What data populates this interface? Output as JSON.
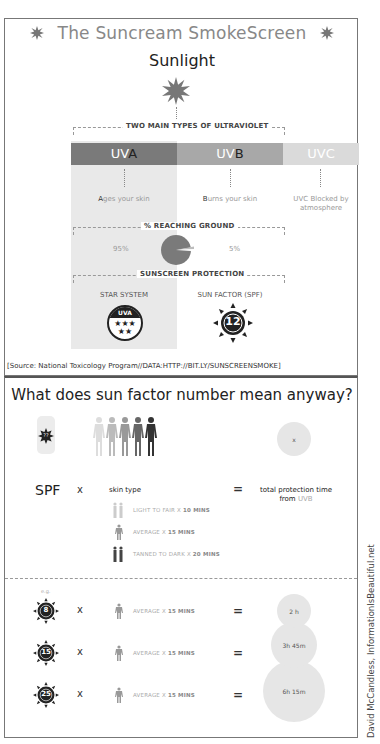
{
  "header": {
    "title": "The Suncream SmokeScreen",
    "subtitle": "Sunlight"
  },
  "uv_types": {
    "bracket_label": "TWO MAIN TYPES OF ULTRAVIOLET",
    "items": [
      {
        "prefix": "UV",
        "letter": "A",
        "desc_letter": "A",
        "desc_rest": "ges your skin",
        "color": "#7a7a7a"
      },
      {
        "prefix": "UV",
        "letter": "B",
        "desc_letter": "B",
        "desc_rest": "urns your skin",
        "color": "#a8a8a8"
      },
      {
        "prefix": "UVC",
        "letter": "",
        "desc_letter": "",
        "desc_rest": "UVC Blocked by atmosphere",
        "color": "#dadada"
      }
    ]
  },
  "reaching_ground": {
    "bracket_label": "% REACHING GROUND",
    "uva_pct": "95%",
    "uvb_pct": "5%",
    "pie_color": "#7a7a7a",
    "slice_color": "#bdbdbd"
  },
  "protection": {
    "bracket_label": "SUNSCREEN PROTECTION",
    "star_label": "STAR SYSTEM",
    "star_badge": "UVA",
    "spf_label": "SUN FACTOR (SPF)",
    "spf_value": "12"
  },
  "source": "[Source: National Toxicology Program//DATA:HTTP://BIT.LY/SUNSCREENSMOKE]",
  "explainer": {
    "title": "What does sun factor number mean anyway?",
    "bottle_label": "??",
    "result_bubble": "x",
    "spf": "SPF",
    "times": "x",
    "skin_type": "skin type",
    "equals": "=",
    "total_line1": "total protection time",
    "total_line2_prefix": "from ",
    "total_line2_uv": "UVB",
    "skin_types": [
      {
        "label": "LIGHT TO FAIR X ",
        "mins": "10 MINS"
      },
      {
        "label": "AVERAGE X ",
        "mins": "15 MINS"
      },
      {
        "label": "TANNED TO DARK X ",
        "mins": "20 MINS"
      }
    ]
  },
  "examples": {
    "eg": "e.g.",
    "rows": [
      {
        "spf": "8",
        "times": "x",
        "label": "AVERAGE X ",
        "mins": "15 MINS",
        "equals": "=",
        "result": "2 h"
      },
      {
        "spf": "15",
        "times": "x",
        "label": "AVERAGE X ",
        "mins": "15 MINS",
        "equals": "=",
        "result": "3h 45m"
      },
      {
        "spf": "25",
        "times": "x",
        "label": "AVERAGE X ",
        "mins": "15 MINS",
        "equals": "=",
        "result": "6h 15m"
      }
    ]
  },
  "credit": "David McCandless, InformationIsBeautiful.net"
}
